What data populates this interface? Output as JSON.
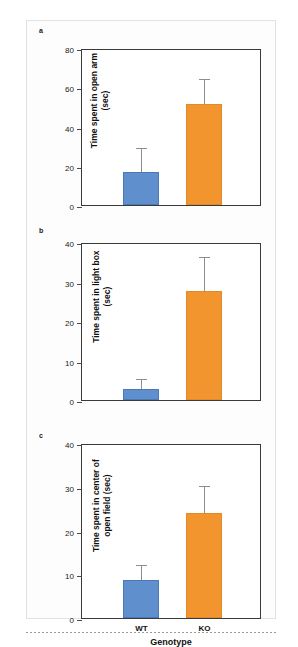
{
  "figure": {
    "panels": [
      {
        "letter": "a",
        "ylabel": "Time spent in open arm\n(sec)",
        "yticks": [
          0,
          20,
          40,
          60,
          80
        ],
        "ymax": 80
      },
      {
        "letter": "b",
        "ylabel": "Time spent in light box\n(sec)",
        "yticks": [
          0,
          10,
          20,
          30,
          40
        ],
        "ymax": 40
      },
      {
        "letter": "c",
        "ylabel": "Time spent in center of\nopen field (sec)",
        "yticks": [
          0,
          10,
          20,
          30,
          40
        ],
        "ymax": 40,
        "xlabel": "Genotype"
      }
    ],
    "categories": [
      "WT",
      "KO"
    ],
    "colors": {
      "wt_bar": "#5f8fcc",
      "ko_bar": "#f2952f",
      "error_bar": "#8d8d8d",
      "axis": "#3a3a3a"
    }
  },
  "chart_data": [
    {
      "type": "bar",
      "panel": "a",
      "title": "",
      "categories": [
        "WT",
        "KO"
      ],
      "values": [
        16.8,
        51.5
      ],
      "errors": [
        11.7,
        12.0
      ],
      "xlabel": "",
      "ylabel": "Time spent in open arm (sec)",
      "ylim": [
        0,
        80
      ],
      "yticks": [
        0,
        20,
        40,
        60,
        80
      ],
      "grid": false,
      "legend": "none",
      "series_colors": [
        "#5f8fcc",
        "#f2952f"
      ]
    },
    {
      "type": "bar",
      "panel": "b",
      "title": "",
      "categories": [
        "WT",
        "KO"
      ],
      "values": [
        2.8,
        27.5
      ],
      "errors": [
        2.3,
        8.5
      ],
      "xlabel": "",
      "ylabel": "Time spent in light box (sec)",
      "ylim": [
        0,
        40
      ],
      "yticks": [
        0,
        10,
        20,
        30,
        40
      ],
      "grid": false,
      "legend": "none",
      "series_colors": [
        "#5f8fcc",
        "#f2952f"
      ]
    },
    {
      "type": "bar",
      "panel": "c",
      "title": "",
      "categories": [
        "WT",
        "KO"
      ],
      "values": [
        8.6,
        24.0
      ],
      "errors": [
        3.4,
        6.0
      ],
      "xlabel": "Genotype",
      "ylabel": "Time spent in center of open field (sec)",
      "ylim": [
        0,
        40
      ],
      "yticks": [
        0,
        10,
        20,
        30,
        40
      ],
      "grid": false,
      "legend": "none",
      "series_colors": [
        "#5f8fcc",
        "#f2952f"
      ]
    }
  ]
}
